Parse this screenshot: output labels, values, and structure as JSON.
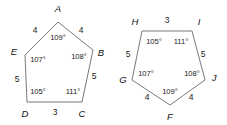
{
  "figure": {
    "background_color": "#ffffff",
    "stroke_color": "#6a6a6a",
    "text_color": "#1a1a1a",
    "shapes": [
      {
        "name": "pentagon-abcde",
        "vertices": [
          {
            "label": "A",
            "x": 58,
            "y": 22,
            "lx": 58,
            "ly": 9.5,
            "anchor": "middle"
          },
          {
            "label": "B",
            "x": 93,
            "y": 50,
            "lx": 101,
            "ly": 53,
            "anchor": "middle"
          },
          {
            "label": "C",
            "x": 82,
            "y": 102,
            "lx": 82,
            "ly": 114,
            "anchor": "middle"
          },
          {
            "label": "D",
            "x": 27,
            "y": 102,
            "lx": 25,
            "ly": 114,
            "anchor": "middle"
          },
          {
            "label": "E",
            "x": 25,
            "y": 55,
            "lx": 14,
            "ly": 52,
            "anchor": "middle"
          }
        ],
        "angles": [
          {
            "at": "A",
            "value": "109°",
            "x": 58,
            "y": 38
          },
          {
            "at": "B",
            "value": "108°",
            "x": 79,
            "y": 57
          },
          {
            "at": "C",
            "value": "111°",
            "x": 73,
            "y": 92
          },
          {
            "at": "D",
            "value": "105°",
            "x": 38,
            "y": 92
          },
          {
            "at": "E",
            "value": "107°",
            "x": 38,
            "y": 60
          }
        ],
        "sides": [
          {
            "between": "E-A",
            "value": "4",
            "x": 35,
            "y": 31
          },
          {
            "between": "A-B",
            "value": "4",
            "x": 81,
            "y": 31
          },
          {
            "between": "B-C",
            "value": "5",
            "x": 94,
            "y": 77
          },
          {
            "between": "C-D",
            "value": "3",
            "x": 55,
            "y": 113
          },
          {
            "between": "D-E",
            "value": "5",
            "x": 17,
            "y": 80
          }
        ]
      },
      {
        "name": "pentagon-fghij",
        "vertices": [
          {
            "label": "F",
            "x": 170,
            "y": 105,
            "lx": 170,
            "ly": 117,
            "anchor": "middle"
          },
          {
            "label": "G",
            "x": 132,
            "y": 80,
            "lx": 123,
            "ly": 80,
            "anchor": "middle"
          },
          {
            "label": "H",
            "x": 142,
            "y": 31,
            "lx": 135,
            "ly": 22,
            "anchor": "middle"
          },
          {
            "label": "I",
            "x": 192,
            "y": 31,
            "lx": 199,
            "ly": 22,
            "anchor": "middle"
          },
          {
            "label": "J",
            "x": 205,
            "y": 80,
            "lx": 214,
            "ly": 78,
            "anchor": "middle"
          }
        ],
        "angles": [
          {
            "at": "F",
            "value": "109°",
            "x": 170,
            "y": 92
          },
          {
            "at": "G",
            "value": "107°",
            "x": 146,
            "y": 74
          },
          {
            "at": "H",
            "value": "105°",
            "x": 154,
            "y": 42
          },
          {
            "at": "I",
            "value": "111°",
            "x": 181,
            "y": 42
          },
          {
            "at": "J",
            "value": "108°",
            "x": 192,
            "y": 74
          }
        ],
        "sides": [
          {
            "between": "H-I",
            "value": "3",
            "x": 167,
            "y": 21
          },
          {
            "between": "I-J",
            "value": "5",
            "x": 203,
            "y": 55
          },
          {
            "between": "J-F",
            "value": "4",
            "x": 191,
            "y": 98
          },
          {
            "between": "F-G",
            "value": "4",
            "x": 147,
            "y": 98
          },
          {
            "between": "G-H",
            "value": "5",
            "x": 128,
            "y": 55
          }
        ]
      }
    ]
  }
}
